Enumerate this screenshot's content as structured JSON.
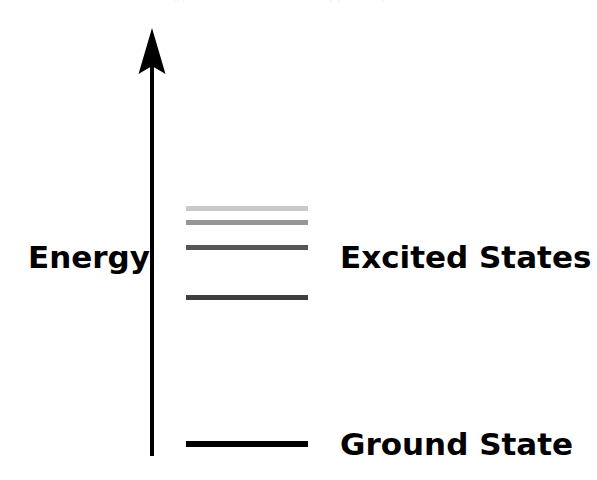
{
  "figure": {
    "background_color": "#ffffff",
    "width": 597,
    "height": 480,
    "top_caption": "Energy levels of an atom (clipped caption)"
  },
  "axis": {
    "label": "Energy",
    "color": "#000000",
    "orientation": "vertical",
    "arrow_direction": "up",
    "arrow_head_style": "barbed",
    "line_x": 152,
    "top_y": 30,
    "bottom_y": 448,
    "shaft_width": 4
  },
  "labels": {
    "excited_states": "Excited States",
    "ground_state": "Ground State"
  },
  "chart_data": {
    "type": "energy-level-diagram",
    "title": "",
    "xlabel": "",
    "ylabel": "Energy",
    "grid": false,
    "legend": "none",
    "axis_range_note": "Energy increases upward; no numeric scale shown",
    "level_x_start": 186,
    "level_x_end": 308,
    "levels": [
      {
        "name": "excited-state-4",
        "kind": "excited",
        "y": 206,
        "color": "#c9c9c9",
        "thickness": 5,
        "order_from_top": 1
      },
      {
        "name": "excited-state-3",
        "kind": "excited",
        "y": 220,
        "color": "#969696",
        "thickness": 5,
        "order_from_top": 2
      },
      {
        "name": "excited-state-2",
        "kind": "excited",
        "y": 245,
        "color": "#565656",
        "thickness": 5,
        "order_from_top": 3
      },
      {
        "name": "excited-state-1",
        "kind": "excited",
        "y": 295,
        "color": "#3e3e3e",
        "thickness": 5,
        "order_from_top": 4
      },
      {
        "name": "ground-state",
        "kind": "ground",
        "y": 441,
        "color": "#000000",
        "thickness": 6,
        "order_from_top": 5
      }
    ],
    "annotations": [
      {
        "text": "Excited States",
        "x": 340,
        "y": 243
      },
      {
        "text": "Ground State",
        "x": 340,
        "y": 430
      },
      {
        "text": "Energy",
        "x": 28,
        "y": 240
      }
    ]
  }
}
